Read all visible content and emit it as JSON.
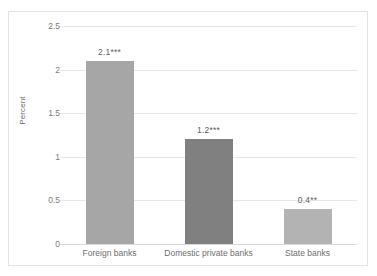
{
  "chart_data": {
    "type": "bar",
    "title": "",
    "xlabel": "",
    "ylabel": "Percent",
    "categories": [
      "Foreign banks",
      "Domestic private banks",
      "State banks"
    ],
    "values": [
      2.1,
      1.2,
      0.4
    ],
    "data_labels": [
      "2.1***",
      "1.2***",
      "0.4**"
    ],
    "bar_colors": [
      "#a6a6a6",
      "#808080",
      "#b3b3b3"
    ],
    "ylim": [
      0,
      2.5
    ],
    "y_ticks": [
      0,
      0.5,
      1,
      1.5,
      2,
      2.5
    ],
    "y_tick_labels": [
      "0",
      "0.5",
      "1",
      "1.5",
      "2",
      "2.5"
    ],
    "grid": true,
    "legend": "none",
    "series": [
      {
        "name": "Percent",
        "points": [
          {
            "category": "Foreign banks",
            "value": 2.1,
            "label": "2.1***",
            "color": "#a6a6a6"
          },
          {
            "category": "Domestic private banks",
            "value": 1.2,
            "label": "1.2***",
            "color": "#808080"
          },
          {
            "category": "State banks",
            "value": 0.4,
            "label": "0.4**",
            "color": "#b3b3b3"
          }
        ]
      }
    ]
  },
  "axes": {
    "y_title": "Percent"
  },
  "style": {
    "border_color": "#e3e3e3",
    "gridline_color": "#e8e8e8",
    "baseline_color": "#d9d9d9",
    "tick_text_color": "#7d7d7d",
    "label_text_color": "#5e5e5e",
    "background": "#ffffff"
  }
}
